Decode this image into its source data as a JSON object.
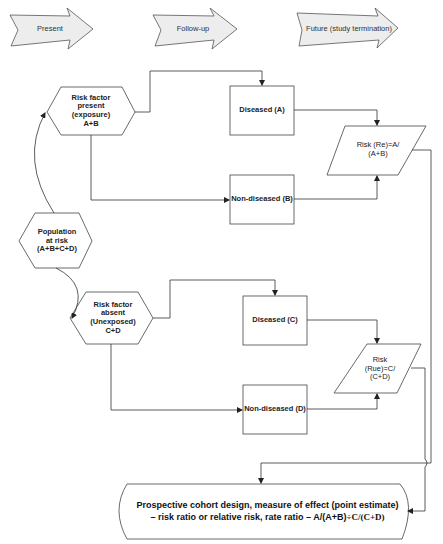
{
  "timeline": [
    {
      "label": "Present"
    },
    {
      "label": "Follow-up"
    },
    {
      "label": "Future (study termination)"
    }
  ],
  "nodes": {
    "population": {
      "lines": [
        "Population",
        "at risk",
        "(A+B+C+D)"
      ]
    },
    "exposed": {
      "lines": [
        "Risk factor",
        "present",
        "(exposure)",
        "A+B"
      ]
    },
    "unexposed": {
      "lines": [
        "Risk factor",
        "absent",
        "(Unexposed)",
        "C+D"
      ]
    },
    "diseased_a": {
      "label": "Diseased (A)"
    },
    "nondiseased_b": {
      "label": "Non-diseased (B)"
    },
    "diseased_c": {
      "label": "Diseased (C)"
    },
    "nondiseased_d": {
      "label": "Non-diseased (D)"
    },
    "risk_exposed": {
      "lines": [
        "Risk (Re)=A/",
        "(A+B)"
      ]
    },
    "risk_unexposed": {
      "lines": [
        "Risk",
        "(Rue)=C/",
        "(C+D)"
      ]
    }
  },
  "conclusion": {
    "line1": "Prospective cohort design, measure of effect (point estimate)",
    "line2_prefix": "– risk ratio or relative risk, rate ratio – A/(A+B)",
    "line2_suffix": "÷C/(C+D)"
  },
  "colors": {
    "arrow_fill": "#ededed",
    "stroke": "#444444"
  }
}
